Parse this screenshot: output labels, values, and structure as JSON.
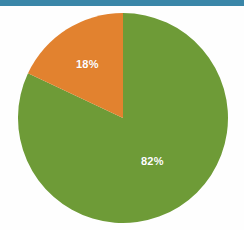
{
  "slide": {
    "background_color": "#fefefe",
    "accent_bar_color": "#3a86a8"
  },
  "chart_data": {
    "type": "pie",
    "title": "",
    "subtitle": "",
    "xlabel": "",
    "ylabel": "",
    "legend": false,
    "legend_position": "none",
    "grid": false,
    "start_angle_deg": 0,
    "direction": "clockwise",
    "center": {
      "x": 123,
      "y": 118
    },
    "radius": 105,
    "categories": [
      "82%",
      "18%"
    ],
    "values": [
      82,
      18
    ],
    "value_unit": "percent",
    "labels": [
      "82%",
      "18%"
    ],
    "colors": [
      "#6e9b37",
      "#e2822f"
    ],
    "slices": [
      {
        "name": "green-slice",
        "label": "82%",
        "value": 82,
        "color": "#6e9b37",
        "start_angle_deg": 0,
        "end_angle_deg": 295.2
      },
      {
        "name": "orange-slice",
        "label": "18%",
        "value": 18,
        "color": "#e2822f",
        "start_angle_deg": 295.2,
        "end_angle_deg": 360
      }
    ],
    "label_text_color": "#ffffff"
  }
}
